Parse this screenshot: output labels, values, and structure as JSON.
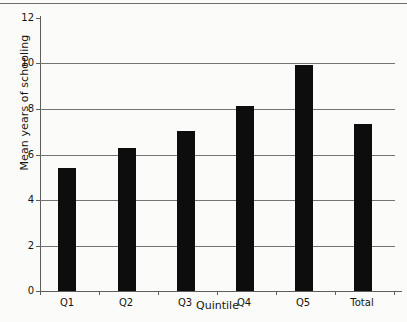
{
  "chart_data": {
    "type": "bar",
    "title": "",
    "categories": [
      "Q1",
      "Q2",
      "Q3",
      "Q4",
      "Q5",
      "Total"
    ],
    "values": [
      5.4,
      6.3,
      7.05,
      8.15,
      9.93,
      7.35
    ],
    "xlabel": "Quintile",
    "ylabel": "Mean years of schooling",
    "ylim": [
      0,
      12
    ],
    "yticks": [
      0,
      2,
      4,
      6,
      8,
      10,
      12
    ],
    "ytick_labels": [
      "0",
      "2",
      "4",
      "6",
      "8",
      "10",
      "12"
    ],
    "gridlines": [
      2,
      4,
      6,
      8,
      10
    ],
    "grid": true,
    "legend": "none",
    "bar_color": "#0d0d0d",
    "axis_color": "#5d5d5d",
    "grid_color": "#737373",
    "background": "#fbfbfa"
  }
}
